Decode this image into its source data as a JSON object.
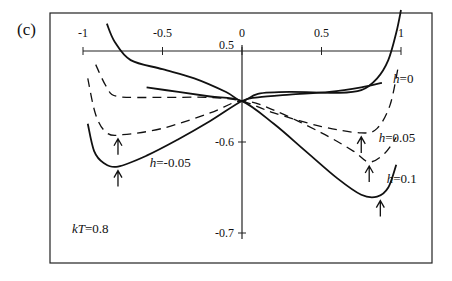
{
  "panel_label": "(c)",
  "annotation": "kT=0.8",
  "chart_data": {
    "type": "line",
    "title": "",
    "xlabel": "",
    "ylabel": "",
    "xlim": [
      -1,
      1
    ],
    "ylim": [
      -0.7,
      -0.5
    ],
    "x_ticks": [
      -1,
      -0.5,
      0,
      0.5,
      1
    ],
    "x_tick_labels": [
      "-1",
      "-0.5",
      "0",
      "0.5",
      "1"
    ],
    "y_ticks": [
      -0.5,
      -0.6,
      -0.7
    ],
    "y_tick_labels": [
      "0.5",
      "-0.6",
      "-0.7"
    ],
    "grid": false,
    "legend": "inline curve labels",
    "annotations": [
      "kT=0.8",
      "arrows mark curve minima"
    ],
    "series": [
      {
        "name": "h=0",
        "style": "solid",
        "x": [
          -0.85,
          -0.8,
          -0.7,
          -0.5,
          -0.3,
          -0.1,
          0,
          0.1,
          0.3,
          0.6,
          0.75,
          0.85,
          0.92,
          0.97,
          1.0
        ],
        "y": [
          -0.47,
          -0.49,
          -0.51,
          -0.52,
          -0.53,
          -0.545,
          -0.555,
          -0.547,
          -0.545,
          -0.546,
          -0.543,
          -0.53,
          -0.51,
          -0.48,
          -0.455
        ]
      },
      {
        "name": "h=0.05",
        "style": "dashed",
        "x": [
          -0.92,
          -0.85,
          -0.78,
          -0.5,
          -0.2,
          0,
          0.2,
          0.5,
          0.75,
          0.85,
          0.93,
          0.98
        ],
        "y": [
          -0.515,
          -0.54,
          -0.55,
          -0.551,
          -0.551,
          -0.555,
          -0.568,
          -0.583,
          -0.59,
          -0.585,
          -0.56,
          -0.52
        ]
      },
      {
        "name": "h=-0.05 (dashed)",
        "style": "dashed",
        "x": [
          -0.97,
          -0.92,
          -0.85,
          -0.75,
          -0.5,
          -0.2,
          0,
          0.2,
          0.5,
          0.7,
          0.8,
          0.9,
          0.97
        ],
        "y": [
          -0.53,
          -0.57,
          -0.59,
          -0.592,
          -0.585,
          -0.568,
          -0.555,
          -0.565,
          -0.59,
          -0.61,
          -0.622,
          -0.612,
          -0.595
        ]
      },
      {
        "name": "h=-0.05",
        "style": "solid",
        "x": [
          -0.97,
          -0.93,
          -0.87,
          -0.78,
          -0.6,
          -0.4,
          -0.2,
          0,
          0.1,
          0.3,
          0.55,
          0.75,
          0.88
        ],
        "y": [
          -0.58,
          -0.61,
          -0.623,
          -0.627,
          -0.615,
          -0.597,
          -0.577,
          -0.555,
          -0.551,
          -0.548,
          -0.545,
          -0.54,
          -0.535
        ]
      },
      {
        "name": "h=0.1",
        "style": "solid",
        "x": [
          -0.6,
          -0.4,
          -0.2,
          0,
          0.2,
          0.4,
          0.6,
          0.75,
          0.85,
          0.92,
          0.97
        ],
        "y": [
          -0.54,
          -0.545,
          -0.55,
          -0.555,
          -0.58,
          -0.61,
          -0.64,
          -0.658,
          -0.66,
          -0.65,
          -0.625
        ]
      }
    ],
    "minima_arrows": [
      {
        "x": -0.78,
        "y": -0.592
      },
      {
        "x": -0.78,
        "y": -0.627
      },
      {
        "x": 0.75,
        "y": -0.59
      },
      {
        "x": 0.8,
        "y": -0.622
      },
      {
        "x": 0.87,
        "y": -0.66
      }
    ],
    "curve_labels": [
      {
        "text": "h=0",
        "x": 0.95,
        "y": -0.535
      },
      {
        "text": "h=0.05",
        "x": 0.86,
        "y": -0.6
      },
      {
        "text": "h=-0.05",
        "x": -0.58,
        "y": -0.628
      },
      {
        "text": "h=0.1",
        "x": 0.91,
        "y": -0.645
      }
    ]
  }
}
